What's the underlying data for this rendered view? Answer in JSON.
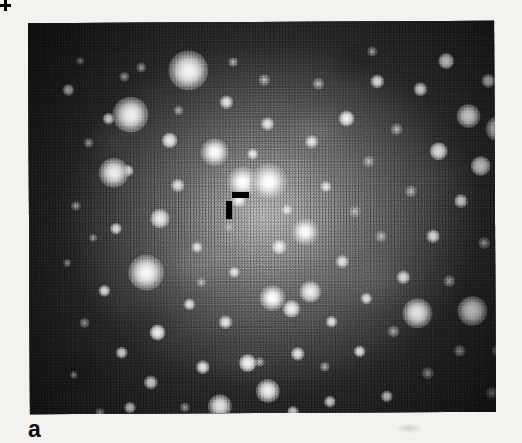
{
  "figure": {
    "panel_label": "a",
    "caption_text": "",
    "background_color": "#f3f2ee"
  },
  "image": {
    "kind": "astronomical-star-field",
    "description": "Grayscale photographic plate of a dense stellar field with a bright diffuse central concentration",
    "colorspace": "grayscale",
    "frame": {
      "x": 29,
      "y": 22,
      "width": 466,
      "height": 391
    },
    "tone": {
      "core_gray": "#8d8d8d",
      "mid_gray": "#636363",
      "edge_gray": "#2c2c2c",
      "corner_black": "#1b1b1b",
      "star_core_white": "#ffffff"
    }
  },
  "markers": [
    {
      "name": "tick-horizontal",
      "shape": "bar",
      "orientation": "horizontal",
      "color": "#000000",
      "x": 232,
      "y": 192,
      "width": 17,
      "height": 6
    },
    {
      "name": "tick-vertical",
      "shape": "bar",
      "orientation": "vertical",
      "color": "#000000",
      "x": 226,
      "y": 201,
      "width": 6,
      "height": 18
    },
    {
      "name": "position-cross",
      "shape": "plus",
      "color": "#000000",
      "x": 253,
      "y": 254,
      "width": 11,
      "height": 11
    }
  ],
  "stars": [
    {
      "x": 40,
      "y": 67,
      "r": 6,
      "class": "small"
    },
    {
      "x": 52,
      "y": 38,
      "r": 4,
      "class": "faint"
    },
    {
      "x": 60,
      "y": 120,
      "r": 5,
      "class": "faint"
    },
    {
      "x": 47,
      "y": 183,
      "r": 5,
      "class": "faint"
    },
    {
      "x": 38,
      "y": 240,
      "r": 4,
      "class": "faint"
    },
    {
      "x": 55,
      "y": 300,
      "r": 5,
      "class": "faint"
    },
    {
      "x": 44,
      "y": 352,
      "r": 4,
      "class": "faint"
    },
    {
      "x": 80,
      "y": 96,
      "r": 6,
      "class": "small"
    },
    {
      "x": 96,
      "y": 54,
      "r": 5,
      "class": "faint"
    },
    {
      "x": 99,
      "y": 148,
      "r": 6,
      "class": "small"
    },
    {
      "x": 87,
      "y": 206,
      "r": 6,
      "class": "small"
    },
    {
      "x": 75,
      "y": 268,
      "r": 6,
      "class": "small"
    },
    {
      "x": 92,
      "y": 330,
      "r": 6,
      "class": "small"
    },
    {
      "x": 70,
      "y": 390,
      "r": 5,
      "class": "faint"
    },
    {
      "x": 100,
      "y": 385,
      "r": 6,
      "class": "small"
    },
    {
      "x": 102,
      "y": 92,
      "r": 18,
      "class": "big"
    },
    {
      "x": 160,
      "y": 48,
      "r": 20,
      "class": "big"
    },
    {
      "x": 85,
      "y": 150,
      "r": 15,
      "class": "big"
    },
    {
      "x": 117,
      "y": 250,
      "r": 18,
      "class": "big"
    },
    {
      "x": 131,
      "y": 196,
      "r": 10,
      "class": "med"
    },
    {
      "x": 141,
      "y": 118,
      "r": 8,
      "class": "med"
    },
    {
      "x": 149,
      "y": 163,
      "r": 7,
      "class": "small"
    },
    {
      "x": 128,
      "y": 310,
      "r": 8,
      "class": "med"
    },
    {
      "x": 121,
      "y": 360,
      "r": 7,
      "class": "small"
    },
    {
      "x": 160,
      "y": 282,
      "r": 6,
      "class": "small"
    },
    {
      "x": 168,
      "y": 225,
      "r": 6,
      "class": "small"
    },
    {
      "x": 173,
      "y": 345,
      "r": 7,
      "class": "small"
    },
    {
      "x": 186,
      "y": 130,
      "r": 14,
      "class": "big"
    },
    {
      "x": 198,
      "y": 80,
      "r": 7,
      "class": "small"
    },
    {
      "x": 190,
      "y": 384,
      "r": 12,
      "class": "big"
    },
    {
      "x": 196,
      "y": 300,
      "r": 7,
      "class": "small"
    },
    {
      "x": 205,
      "y": 250,
      "r": 6,
      "class": "small"
    },
    {
      "x": 210,
      "y": 178,
      "r": 8,
      "class": "med"
    },
    {
      "x": 218,
      "y": 341,
      "r": 9,
      "class": "med"
    },
    {
      "x": 214,
      "y": 160,
      "r": 16,
      "class": "big"
    },
    {
      "x": 240,
      "y": 160,
      "r": 19,
      "class": "big"
    },
    {
      "x": 239,
      "y": 102,
      "r": 7,
      "class": "small"
    },
    {
      "x": 236,
      "y": 58,
      "r": 6,
      "class": "faint"
    },
    {
      "x": 250,
      "y": 225,
      "r": 8,
      "class": "med"
    },
    {
      "x": 243,
      "y": 276,
      "r": 13,
      "class": "big"
    },
    {
      "x": 262,
      "y": 287,
      "r": 9,
      "class": "med"
    },
    {
      "x": 238,
      "y": 369,
      "r": 12,
      "class": "big"
    },
    {
      "x": 268,
      "y": 332,
      "r": 7,
      "class": "small"
    },
    {
      "x": 276,
      "y": 210,
      "r": 14,
      "class": "big"
    },
    {
      "x": 283,
      "y": 120,
      "r": 7,
      "class": "small"
    },
    {
      "x": 290,
      "y": 62,
      "r": 6,
      "class": "faint"
    },
    {
      "x": 281,
      "y": 270,
      "r": 11,
      "class": "med"
    },
    {
      "x": 297,
      "y": 165,
      "r": 6,
      "class": "small"
    },
    {
      "x": 302,
      "y": 300,
      "r": 6,
      "class": "small"
    },
    {
      "x": 300,
      "y": 380,
      "r": 6,
      "class": "small"
    },
    {
      "x": 313,
      "y": 240,
      "r": 7,
      "class": "small"
    },
    {
      "x": 318,
      "y": 97,
      "r": 8,
      "class": "med"
    },
    {
      "x": 326,
      "y": 190,
      "r": 6,
      "class": "faint"
    },
    {
      "x": 330,
      "y": 330,
      "r": 6,
      "class": "small"
    },
    {
      "x": 337,
      "y": 277,
      "r": 6,
      "class": "small"
    },
    {
      "x": 340,
      "y": 140,
      "r": 6,
      "class": "faint"
    },
    {
      "x": 349,
      "y": 60,
      "r": 7,
      "class": "small"
    },
    {
      "x": 352,
      "y": 215,
      "r": 6,
      "class": "faint"
    },
    {
      "x": 357,
      "y": 375,
      "r": 6,
      "class": "small"
    },
    {
      "x": 364,
      "y": 310,
      "r": 6,
      "class": "faint"
    },
    {
      "x": 368,
      "y": 108,
      "r": 6,
      "class": "faint"
    },
    {
      "x": 374,
      "y": 256,
      "r": 7,
      "class": "small"
    },
    {
      "x": 382,
      "y": 170,
      "r": 6,
      "class": "faint"
    },
    {
      "x": 388,
      "y": 292,
      "r": 15,
      "class": "big"
    },
    {
      "x": 392,
      "y": 68,
      "r": 7,
      "class": "small"
    },
    {
      "x": 398,
      "y": 352,
      "r": 6,
      "class": "faint"
    },
    {
      "x": 404,
      "y": 215,
      "r": 7,
      "class": "small"
    },
    {
      "x": 410,
      "y": 130,
      "r": 9,
      "class": "med"
    },
    {
      "x": 418,
      "y": 40,
      "r": 8,
      "class": "med"
    },
    {
      "x": 420,
      "y": 260,
      "r": 6,
      "class": "faint"
    },
    {
      "x": 430,
      "y": 330,
      "r": 6,
      "class": "faint"
    },
    {
      "x": 432,
      "y": 180,
      "r": 7,
      "class": "small"
    },
    {
      "x": 440,
      "y": 95,
      "r": 12,
      "class": "big"
    },
    {
      "x": 443,
      "y": 290,
      "r": 15,
      "class": "big"
    },
    {
      "x": 452,
      "y": 145,
      "r": 10,
      "class": "med"
    },
    {
      "x": 455,
      "y": 222,
      "r": 6,
      "class": "faint"
    },
    {
      "x": 460,
      "y": 60,
      "r": 7,
      "class": "small"
    },
    {
      "x": 462,
      "y": 372,
      "r": 6,
      "class": "faint"
    },
    {
      "x": 470,
      "y": 108,
      "r": 13,
      "class": "big"
    },
    {
      "x": 468,
      "y": 330,
      "r": 6,
      "class": "faint"
    },
    {
      "x": 478,
      "y": 200,
      "r": 7,
      "class": "small"
    },
    {
      "x": 484,
      "y": 262,
      "r": 6,
      "class": "faint"
    },
    {
      "x": 488,
      "y": 155,
      "r": 8,
      "class": "med"
    },
    {
      "x": 230,
      "y": 340,
      "r": 5,
      "class": "faint"
    },
    {
      "x": 150,
      "y": 88,
      "r": 5,
      "class": "faint"
    },
    {
      "x": 172,
      "y": 260,
      "r": 5,
      "class": "faint"
    },
    {
      "x": 258,
      "y": 188,
      "r": 6,
      "class": "small"
    },
    {
      "x": 295,
      "y": 345,
      "r": 5,
      "class": "faint"
    },
    {
      "x": 205,
      "y": 40,
      "r": 5,
      "class": "faint"
    },
    {
      "x": 113,
      "y": 45,
      "r": 5,
      "class": "faint"
    },
    {
      "x": 64,
      "y": 215,
      "r": 4,
      "class": "faint"
    },
    {
      "x": 344,
      "y": 30,
      "r": 5,
      "class": "faint"
    },
    {
      "x": 412,
      "y": 395,
      "r": 5,
      "class": "faint"
    },
    {
      "x": 155,
      "y": 385,
      "r": 5,
      "class": "faint"
    },
    {
      "x": 263,
      "y": 390,
      "r": 6,
      "class": "small"
    },
    {
      "x": 224,
      "y": 132,
      "r": 6,
      "class": "small"
    },
    {
      "x": 200,
      "y": 205,
      "r": 5,
      "class": "faint"
    }
  ]
}
